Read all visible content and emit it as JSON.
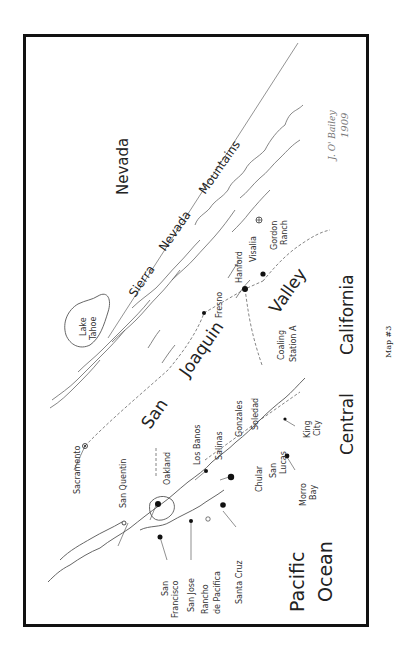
{
  "map": {
    "title": "Map #3",
    "signature": {
      "name": "J. O' Bailey",
      "year": "1909"
    },
    "regions": {
      "nevada": "Nevada",
      "mountains": [
        "Sierra",
        "Nevada",
        "Mountains"
      ],
      "valley": [
        "San",
        "Joaquin",
        "Valley"
      ],
      "central_california": [
        "Central",
        "California"
      ],
      "ocean": [
        "Pacific",
        "Ocean"
      ],
      "lake": [
        "Lake",
        "Tahoe"
      ]
    },
    "places": {
      "sacramento": "Sacramento",
      "san_quentin": "San Quentin",
      "oakland": "Oakland",
      "los_banos": "Los Banos",
      "salinas": "Salinas",
      "gonzales": "Gonzales",
      "soledad": "Soledad",
      "fresno": "Fresno",
      "hanford": "Hanford",
      "visalia": "Visalia",
      "gordon_ranch": [
        "Gordon",
        "Ranch"
      ],
      "coaling_station": [
        "Coaling",
        "Station A"
      ],
      "chular": "Chular",
      "san_lucas": [
        "San",
        "Lucas"
      ],
      "king_city": [
        "King",
        "City"
      ],
      "morro_bay": [
        "Morro",
        "Bay"
      ],
      "san_francisco": [
        "San",
        "Francisco"
      ],
      "san_jose": "San Jose",
      "rancho_de_pacifica": [
        "Rancho",
        "de Pacifica"
      ],
      "santa_cruz": "Santa Cruz"
    },
    "colors": {
      "border": "#111111",
      "ink": "#333333",
      "signature": "#777777"
    }
  }
}
